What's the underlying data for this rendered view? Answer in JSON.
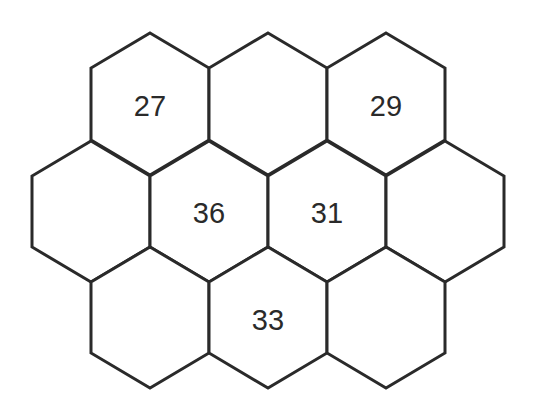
{
  "diagram": {
    "type": "hexagon-number-puzzle",
    "colors": {
      "stroke": "#2a2a2a",
      "fill": "#ffffff",
      "text": "#2a2a2a"
    },
    "rows": [
      {
        "name": "top",
        "cells": [
          {
            "id": "r0c0",
            "value": "27"
          },
          {
            "id": "r0c1",
            "value": ""
          },
          {
            "id": "r0c2",
            "value": "29"
          }
        ]
      },
      {
        "name": "middle",
        "cells": [
          {
            "id": "r1c0",
            "value": ""
          },
          {
            "id": "r1c1",
            "value": "36"
          },
          {
            "id": "r1c2",
            "value": "31"
          },
          {
            "id": "r1c3",
            "value": ""
          }
        ]
      },
      {
        "name": "bottom",
        "cells": [
          {
            "id": "r2c0",
            "value": ""
          },
          {
            "id": "r2c1",
            "value": "33"
          },
          {
            "id": "r2c2",
            "value": ""
          }
        ]
      }
    ]
  }
}
